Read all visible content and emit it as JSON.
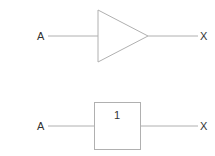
{
  "diagrams": [
    {
      "type": "buffer-triangle",
      "input_label": "A",
      "output_label": "X"
    },
    {
      "type": "buffer-box",
      "input_label": "A",
      "output_label": "X",
      "box_label": "1"
    }
  ],
  "colors": {
    "stroke": "#b0b0b0",
    "text": "#333333"
  }
}
